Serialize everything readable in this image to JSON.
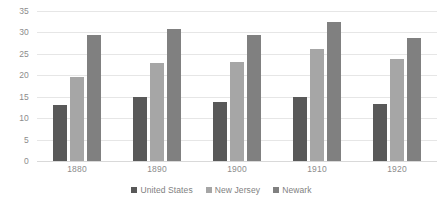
{
  "chart_data": {
    "type": "bar",
    "title": "",
    "xlabel": "",
    "ylabel": "",
    "categories": [
      "1880",
      "1890",
      "1900",
      "1910",
      "1920"
    ],
    "series": [
      {
        "name": "United States",
        "color": "#595959",
        "values": [
          13.1,
          15.0,
          13.8,
          15.0,
          13.4
        ]
      },
      {
        "name": "New Jersey",
        "color": "#a6a6a6",
        "values": [
          19.6,
          22.8,
          23.0,
          26.2,
          23.9
        ]
      },
      {
        "name": "Newark",
        "color": "#808080",
        "values": [
          29.5,
          30.8,
          29.3,
          32.5,
          28.7
        ]
      }
    ],
    "ylim": [
      0,
      35
    ],
    "yticks": [
      "0",
      "5",
      "10",
      "15",
      "20",
      "25",
      "30",
      "35"
    ],
    "ytick_values": [
      0,
      5,
      10,
      15,
      20,
      25,
      30,
      35
    ],
    "grid": true,
    "legend_position": "bottom",
    "gridline_color": "#e6e6e6",
    "axis_text_color": "#8c8c8c"
  },
  "legend": {
    "items": [
      {
        "label": "United States"
      },
      {
        "label": "New Jersey"
      },
      {
        "label": "Newark"
      }
    ]
  },
  "title_sliver": ""
}
